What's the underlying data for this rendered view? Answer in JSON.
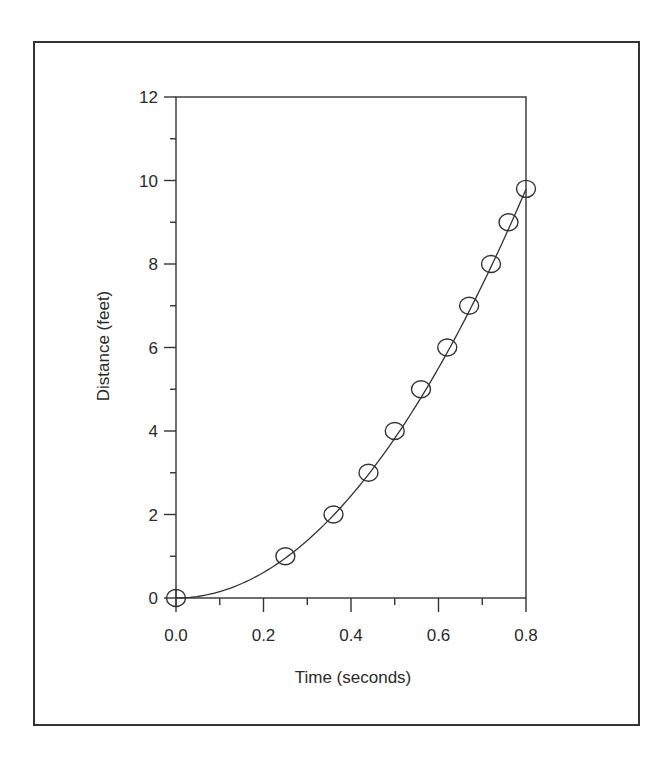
{
  "chart_data": {
    "type": "scatter",
    "title": "",
    "xlabel": "Time (seconds)",
    "ylabel": "Distance (feet)",
    "xlim": [
      0.0,
      0.8
    ],
    "ylim": [
      0,
      12
    ],
    "x_ticks": [
      "0.0",
      "0.2",
      "0.4",
      "0.6",
      "0.8"
    ],
    "x_tick_values": [
      0.0,
      0.2,
      0.4,
      0.6,
      0.8
    ],
    "x_minor_step": 0.1,
    "y_ticks": [
      "0",
      "2",
      "4",
      "6",
      "8",
      "10",
      "12"
    ],
    "y_tick_values": [
      0,
      2,
      4,
      6,
      8,
      10,
      12
    ],
    "y_minor_step": 1,
    "grid": false,
    "legend": null,
    "series": [
      {
        "name": "Measured points",
        "marker": "open-circle",
        "x": [
          0.0,
          0.25,
          0.36,
          0.44,
          0.5,
          0.56,
          0.62,
          0.67,
          0.72,
          0.76,
          0.8
        ],
        "y": [
          0,
          1,
          2,
          3,
          4,
          5,
          6,
          7,
          8,
          9,
          9.8
        ]
      },
      {
        "name": "Fit curve",
        "line": "solid",
        "equation": "d = 15.3 t^2",
        "coef": 15.3
      }
    ]
  }
}
